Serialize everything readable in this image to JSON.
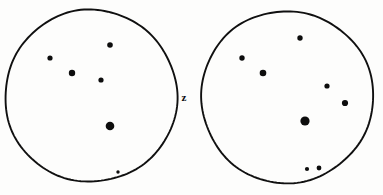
{
  "figure": {
    "background_color": "#fdfdfc",
    "ink_color": "#0d0d0d",
    "width": 383,
    "height": 195,
    "center_label": "z"
  },
  "panels": [
    {
      "id": "left-panel",
      "name": "left-circle",
      "center_x": 91,
      "center_y": 96,
      "radius": 86,
      "stroke_width": 1.9,
      "points": [
        {
          "id": "L1",
          "x": 110,
          "y": 45,
          "r": 2.8
        },
        {
          "id": "L2",
          "x": 50,
          "y": 58,
          "r": 2.6
        },
        {
          "id": "L3",
          "x": 72,
          "y": 73,
          "r": 3.2
        },
        {
          "id": "L4",
          "x": 101,
          "y": 80,
          "r": 2.6
        },
        {
          "id": "L5",
          "x": 110,
          "y": 126,
          "r": 4.3
        },
        {
          "id": "L6",
          "x": 118,
          "y": 172,
          "r": 1.7
        }
      ]
    },
    {
      "id": "right-panel",
      "name": "right-circle",
      "center_x": 287,
      "center_y": 97,
      "radius": 86,
      "stroke_width": 1.9,
      "points": [
        {
          "id": "R1",
          "x": 300,
          "y": 38,
          "r": 2.7
        },
        {
          "id": "R2",
          "x": 242,
          "y": 58,
          "r": 2.7
        },
        {
          "id": "R3",
          "x": 263,
          "y": 73,
          "r": 3.3
        },
        {
          "id": "R4",
          "x": 327,
          "y": 86,
          "r": 2.6
        },
        {
          "id": "R5",
          "x": 345,
          "y": 103,
          "r": 3.1
        },
        {
          "id": "R6",
          "x": 305,
          "y": 121,
          "r": 4.6
        },
        {
          "id": "R7",
          "x": 307,
          "y": 169,
          "r": 2.1
        },
        {
          "id": "R8",
          "x": 319,
          "y": 168,
          "r": 2.4
        }
      ]
    }
  ],
  "label": {
    "text": "z",
    "x": 184,
    "y": 97,
    "font_size": 11
  }
}
